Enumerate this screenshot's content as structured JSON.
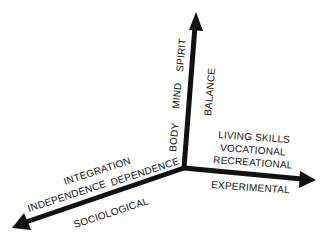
{
  "diagram": {
    "type": "three-axis",
    "colors": {
      "axis": "#111111",
      "text": "#111111",
      "background": "#ffffff"
    },
    "axes": {
      "vertical": {
        "name": "BALANCE",
        "items": [
          "BODY",
          "MIND",
          "SPIRIT"
        ]
      },
      "right": {
        "name": "EXPERIMENTAL",
        "items": [
          "LIVING SKILLS",
          "VOCATIONAL",
          "RECREATIONAL"
        ]
      },
      "left": {
        "name": "SOCIOLOGICAL",
        "items": [
          "INTEGRATION",
          "INDEPENDENCE",
          "DEPENDENCE"
        ]
      }
    }
  }
}
